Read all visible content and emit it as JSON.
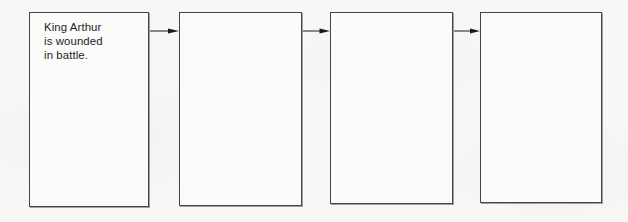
{
  "figure": {
    "type": "sequence-flow-chart",
    "background_color": "#f7f7f5",
    "box_border_color": "#454546",
    "box_fill_color": "#fbfbfa",
    "arrow_color": "#1a1a1a",
    "text_color": "#1d1d1f",
    "box_count": 4,
    "arrow_count": 3
  },
  "boxes": [
    {
      "index": 1,
      "name": "box-1",
      "text": "King Arthur\nis wounded\nin battle.",
      "filled": true,
      "left": 29,
      "top": 12,
      "width": 120,
      "height": 195
    },
    {
      "index": 2,
      "name": "box-2",
      "text": "",
      "filled": false,
      "left": 179,
      "top": 12,
      "width": 123,
      "height": 194
    },
    {
      "index": 3,
      "name": "box-3",
      "text": "",
      "filled": false,
      "left": 330,
      "top": 12,
      "width": 123,
      "height": 192
    },
    {
      "index": 4,
      "name": "box-4",
      "text": "",
      "filled": false,
      "left": 480,
      "top": 12,
      "width": 122,
      "height": 191
    }
  ],
  "arrows": [
    {
      "index": 1,
      "name": "arrow-1",
      "direction": "right",
      "left": 150,
      "top": 24,
      "width": 29
    },
    {
      "index": 2,
      "name": "arrow-2",
      "direction": "right",
      "left": 303,
      "top": 24,
      "width": 27
    },
    {
      "index": 3,
      "name": "arrow-3",
      "direction": "right",
      "left": 454,
      "top": 24,
      "width": 26
    }
  ]
}
